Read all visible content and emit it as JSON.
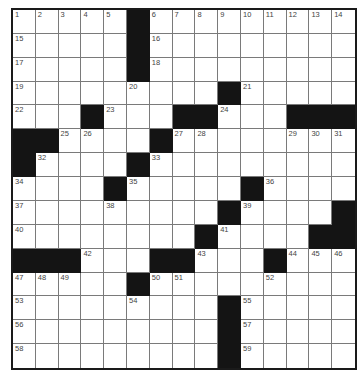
{
  "puzzle": {
    "rows": 15,
    "cols": 15,
    "black_cells": [
      [
        0,
        5
      ],
      [
        1,
        5
      ],
      [
        2,
        5
      ],
      [
        3,
        9
      ],
      [
        4,
        3
      ],
      [
        4,
        7
      ],
      [
        4,
        8
      ],
      [
        4,
        12
      ],
      [
        4,
        13
      ],
      [
        4,
        14
      ],
      [
        5,
        0
      ],
      [
        5,
        1
      ],
      [
        5,
        6
      ],
      [
        6,
        0
      ],
      [
        6,
        5
      ],
      [
        7,
        4
      ],
      [
        7,
        10
      ],
      [
        8,
        9
      ],
      [
        8,
        14
      ],
      [
        9,
        8
      ],
      [
        9,
        13
      ],
      [
        9,
        14
      ],
      [
        10,
        0
      ],
      [
        10,
        1
      ],
      [
        10,
        2
      ],
      [
        10,
        6
      ],
      [
        10,
        7
      ],
      [
        10,
        11
      ],
      [
        11,
        5
      ],
      [
        12,
        9
      ],
      [
        13,
        9
      ],
      [
        14,
        9
      ]
    ],
    "numbers": [
      {
        "r": 0,
        "c": 0,
        "n": "1"
      },
      {
        "r": 0,
        "c": 1,
        "n": "2"
      },
      {
        "r": 0,
        "c": 2,
        "n": "3"
      },
      {
        "r": 0,
        "c": 3,
        "n": "4"
      },
      {
        "r": 0,
        "c": 4,
        "n": "5"
      },
      {
        "r": 0,
        "c": 6,
        "n": "6"
      },
      {
        "r": 0,
        "c": 7,
        "n": "7"
      },
      {
        "r": 0,
        "c": 8,
        "n": "8"
      },
      {
        "r": 0,
        "c": 9,
        "n": "9"
      },
      {
        "r": 0,
        "c": 10,
        "n": "10"
      },
      {
        "r": 0,
        "c": 11,
        "n": "11"
      },
      {
        "r": 0,
        "c": 12,
        "n": "12"
      },
      {
        "r": 0,
        "c": 13,
        "n": "13"
      },
      {
        "r": 0,
        "c": 14,
        "n": "14"
      },
      {
        "r": 1,
        "c": 0,
        "n": "15"
      },
      {
        "r": 1,
        "c": 6,
        "n": "16"
      },
      {
        "r": 2,
        "c": 0,
        "n": "17"
      },
      {
        "r": 2,
        "c": 6,
        "n": "18"
      },
      {
        "r": 3,
        "c": 0,
        "n": "19"
      },
      {
        "r": 3,
        "c": 5,
        "n": "20"
      },
      {
        "r": 3,
        "c": 10,
        "n": "21"
      },
      {
        "r": 4,
        "c": 0,
        "n": "22"
      },
      {
        "r": 4,
        "c": 4,
        "n": "23"
      },
      {
        "r": 4,
        "c": 9,
        "n": "24"
      },
      {
        "r": 5,
        "c": 2,
        "n": "25"
      },
      {
        "r": 5,
        "c": 3,
        "n": "26"
      },
      {
        "r": 5,
        "c": 7,
        "n": "27"
      },
      {
        "r": 5,
        "c": 8,
        "n": "28"
      },
      {
        "r": 5,
        "c": 12,
        "n": "29"
      },
      {
        "r": 5,
        "c": 13,
        "n": "30"
      },
      {
        "r": 5,
        "c": 14,
        "n": "31"
      },
      {
        "r": 6,
        "c": 1,
        "n": "32"
      },
      {
        "r": 6,
        "c": 6,
        "n": "33"
      },
      {
        "r": 7,
        "c": 0,
        "n": "34"
      },
      {
        "r": 7,
        "c": 5,
        "n": "35"
      },
      {
        "r": 7,
        "c": 11,
        "n": "36"
      },
      {
        "r": 8,
        "c": 0,
        "n": "37"
      },
      {
        "r": 8,
        "c": 4,
        "n": "38"
      },
      {
        "r": 8,
        "c": 10,
        "n": "39"
      },
      {
        "r": 9,
        "c": 0,
        "n": "40"
      },
      {
        "r": 9,
        "c": 9,
        "n": "41"
      },
      {
        "r": 10,
        "c": 3,
        "n": "42"
      },
      {
        "r": 10,
        "c": 8,
        "n": "43"
      },
      {
        "r": 10,
        "c": 12,
        "n": "44"
      },
      {
        "r": 10,
        "c": 13,
        "n": "45"
      },
      {
        "r": 10,
        "c": 14,
        "n": "46"
      },
      {
        "r": 11,
        "c": 0,
        "n": "47"
      },
      {
        "r": 11,
        "c": 1,
        "n": "48"
      },
      {
        "r": 11,
        "c": 2,
        "n": "49"
      },
      {
        "r": 11,
        "c": 6,
        "n": "50"
      },
      {
        "r": 11,
        "c": 7,
        "n": "51"
      },
      {
        "r": 11,
        "c": 11,
        "n": "52"
      },
      {
        "r": 12,
        "c": 0,
        "n": "53"
      },
      {
        "r": 12,
        "c": 5,
        "n": "54"
      },
      {
        "r": 12,
        "c": 10,
        "n": "55"
      },
      {
        "r": 13,
        "c": 0,
        "n": "56"
      },
      {
        "r": 13,
        "c": 10,
        "n": "57"
      },
      {
        "r": 14,
        "c": 0,
        "n": "58"
      },
      {
        "r": 14,
        "c": 10,
        "n": "59"
      }
    ]
  }
}
